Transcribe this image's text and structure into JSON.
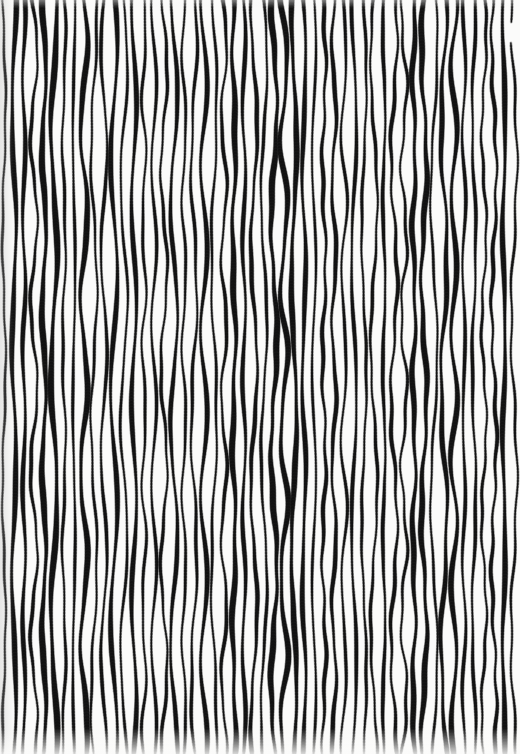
{
  "artwork": {
    "title": "Hand-drawn Vertical Stripe Pattern",
    "medium": "ink on paper (scanned)",
    "width": 520,
    "height": 754,
    "background_color": "#fbfbfa",
    "stripe_color": "#111111",
    "description": "Full-bleed field of closely spaced, slightly wavy hand-drawn vertical black stripes on an off-white ground."
  },
  "pattern": {
    "orientation": "vertical",
    "stripe_count": 52,
    "period_px": 10.0,
    "first_stripe_center_x": 4.0,
    "mean_stripe_width_px": 3.4,
    "min_stripe_width_px": 1.9,
    "max_stripe_width_px": 5.2,
    "wave_amplitude_px": 2.6,
    "wave_wavelength_px": 210,
    "edge_softness_px": 0.8,
    "full_height": true,
    "seed": 20240917
  },
  "anomaly": {
    "name": "broken-stripe",
    "present": true,
    "center_x": 512,
    "gap_start_y": 24,
    "gap_end_y": 41,
    "note": "Rightmost stripe is interrupted by a short blank gap near the top edge."
  },
  "colors": {
    "ink": "#111111",
    "paper": "#fbfbfa",
    "ink_soft": "#2a2a2a",
    "shadow": "#b4b4b4"
  }
}
